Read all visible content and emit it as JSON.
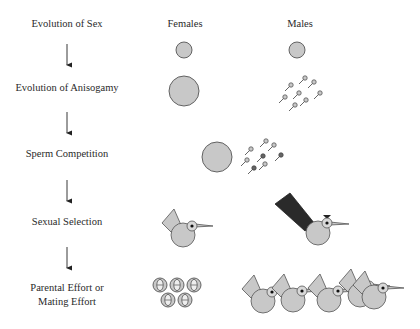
{
  "column_headers": {
    "females": "Females",
    "males": "Males"
  },
  "stages": [
    {
      "label": "Evolution of Sex"
    },
    {
      "label": "Evolution of Anisogamy"
    },
    {
      "label": "Sperm Competition"
    },
    {
      "label": "Sexual Selection"
    },
    {
      "label_line1": "Parental Effort or",
      "label_line2": "Mating Effort"
    }
  ],
  "colors": {
    "fill": "#c8c8c8",
    "stroke": "#555555",
    "dark_tail": "#2a2a2a",
    "text": "#2a2a2a"
  },
  "icons": {
    "stage_arrow": "down-arrow",
    "gamete": "circle",
    "sperm": "sperm",
    "bird": "bird",
    "egg": "egg-with-embryo"
  }
}
